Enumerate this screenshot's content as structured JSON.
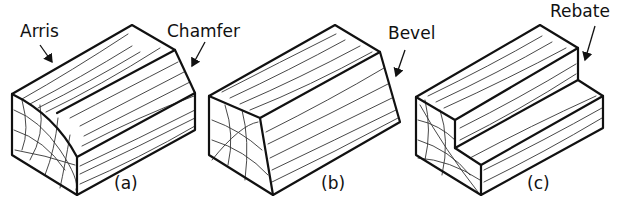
{
  "figure": {
    "panels": [
      {
        "id": "a",
        "caption": "(a)",
        "labels": [
          "Arris",
          "Chamfer"
        ]
      },
      {
        "id": "b",
        "caption": "(b)",
        "labels": [
          "Bevel"
        ]
      },
      {
        "id": "c",
        "caption": "(c)",
        "labels": [
          "Rebate"
        ]
      }
    ]
  },
  "labels": {
    "arris": "Arris",
    "chamfer": "Chamfer",
    "bevel": "Bevel",
    "rebate": "Rebate"
  },
  "captions": {
    "a": "(a)",
    "b": "(b)",
    "c": "(c)"
  },
  "colors": {
    "line": "#111111",
    "background": "#ffffff"
  }
}
